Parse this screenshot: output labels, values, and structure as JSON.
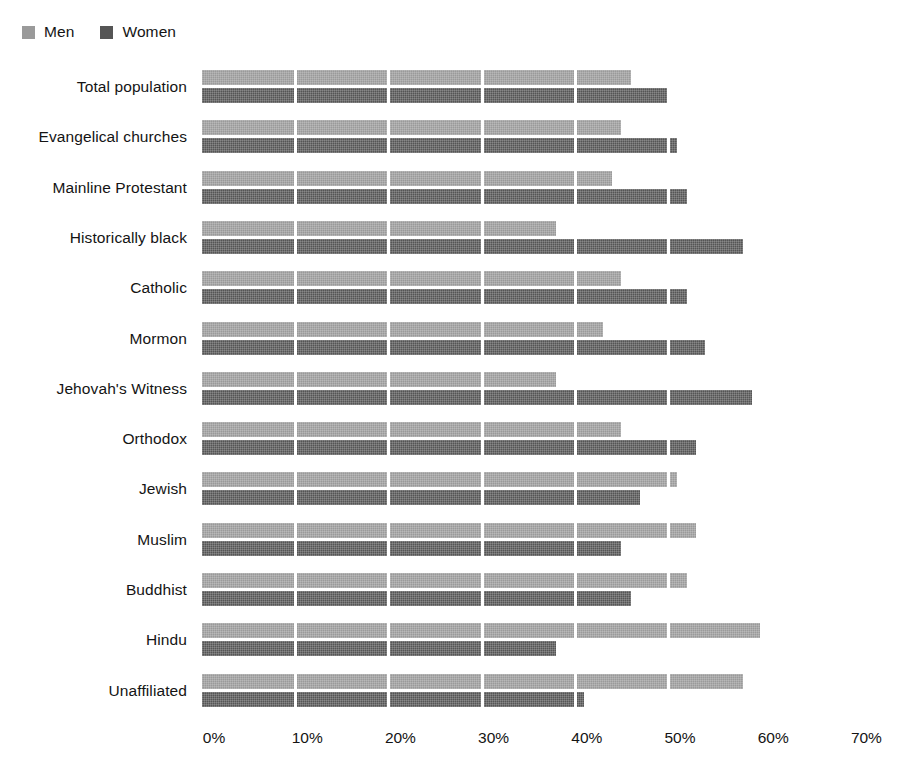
{
  "legend": {
    "entries": [
      {
        "label": "Men",
        "color": "#9a9a9a"
      },
      {
        "label": "Women",
        "color": "#555555"
      }
    ]
  },
  "axis": {
    "ticks": [
      "0%",
      "10%",
      "20%",
      "30%",
      "40%",
      "50%",
      "60%",
      "70%"
    ]
  },
  "chart_data": {
    "type": "bar",
    "orientation": "horizontal",
    "title": "",
    "subtitle": "",
    "xlabel": "",
    "ylabel": "",
    "xlim": [
      0,
      70
    ],
    "xticks": [
      0,
      10,
      20,
      30,
      40,
      50,
      60,
      70
    ],
    "xtick_labels": [
      "0%",
      "10%",
      "20%",
      "30%",
      "40%",
      "50%",
      "60%",
      "70%"
    ],
    "grid": "vertical-white-separators",
    "legend_position": "top-left",
    "categories": [
      "Total population",
      "Evangelical churches",
      "Mainline Protestant",
      "Historically black",
      "Catholic",
      "Mormon",
      "Jehovah's Witness",
      "Orthodox",
      "Jewish",
      "Muslim",
      "Buddhist",
      "Hindu",
      "Unaffiliated"
    ],
    "series": [
      {
        "name": "Men",
        "color": "#9a9a9a",
        "values": [
          46,
          45,
          44,
          38,
          45,
          43,
          38,
          45,
          51,
          53,
          52,
          60,
          58
        ]
      },
      {
        "name": "Women",
        "color": "#555555",
        "values": [
          50,
          51,
          52,
          58,
          52,
          54,
          59,
          53,
          47,
          45,
          46,
          38,
          41
        ]
      }
    ]
  }
}
